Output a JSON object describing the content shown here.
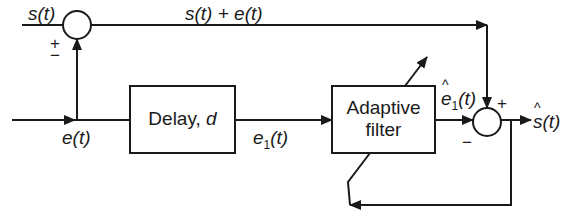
{
  "diagram": {
    "blocks": {
      "delay": {
        "label": "Delay, ",
        "param": "d"
      },
      "adaptive_filter": {
        "line1": "Adaptive",
        "line2": "filter"
      }
    },
    "signals": {
      "s_in": {
        "sym": "s",
        "arg": "(t)"
      },
      "sum_top": {
        "text": "s(t) + e(t)"
      },
      "e_in": {
        "sym": "e",
        "arg": "(t)"
      },
      "e1": {
        "sym": "e",
        "sub": "1",
        "arg": "(t)"
      },
      "e1_hat": {
        "sym": "e",
        "sub": "1",
        "arg": "(t)"
      },
      "s_hat": {
        "sym": "s",
        "arg": "(t)"
      }
    },
    "summers": {
      "top": {
        "plus": "+",
        "minus": "−"
      },
      "bottom": {
        "plus": "+",
        "minus": "−"
      }
    },
    "colors": {
      "stroke": "#1a1a1a",
      "background": "#ffffff"
    }
  }
}
